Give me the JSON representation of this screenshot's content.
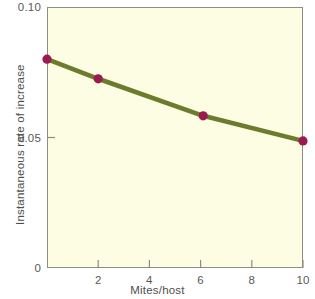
{
  "chart_data": {
    "type": "line",
    "title": "",
    "subtitle": "",
    "xlabel": "Mites/host",
    "ylabel": "Instantaneous rate of increase",
    "xlim": [
      0,
      10
    ],
    "ylim": [
      0,
      0.1
    ],
    "grid": false,
    "legend": "none",
    "x_ticks": [
      {
        "value": 2,
        "label": "2"
      },
      {
        "value": 4,
        "label": "4"
      },
      {
        "value": 6,
        "label": "6"
      },
      {
        "value": 8,
        "label": "8"
      },
      {
        "value": 10,
        "label": "10"
      }
    ],
    "y_ticks": [
      {
        "value": 0,
        "label": "0"
      },
      {
        "value": 0.05,
        "label": "0.05"
      },
      {
        "value": 0.1,
        "label": "0.10"
      }
    ],
    "series": [
      {
        "name": "Instantaneous rate of increase",
        "line_color": "#6d7b2c",
        "marker_color": "#9c1a51",
        "x": [
          0,
          2,
          6.1,
          10
        ],
        "y": [
          0.08,
          0.0725,
          0.0583,
          0.0487
        ]
      }
    ],
    "colors": {
      "plot_background": "#fdfde3",
      "frame": "#8d8d82",
      "line": "#6d7b2c",
      "marker_fill": "#9c1a51",
      "tick_text": "#595954",
      "axis_title_text": "#4f4f4a"
    }
  }
}
